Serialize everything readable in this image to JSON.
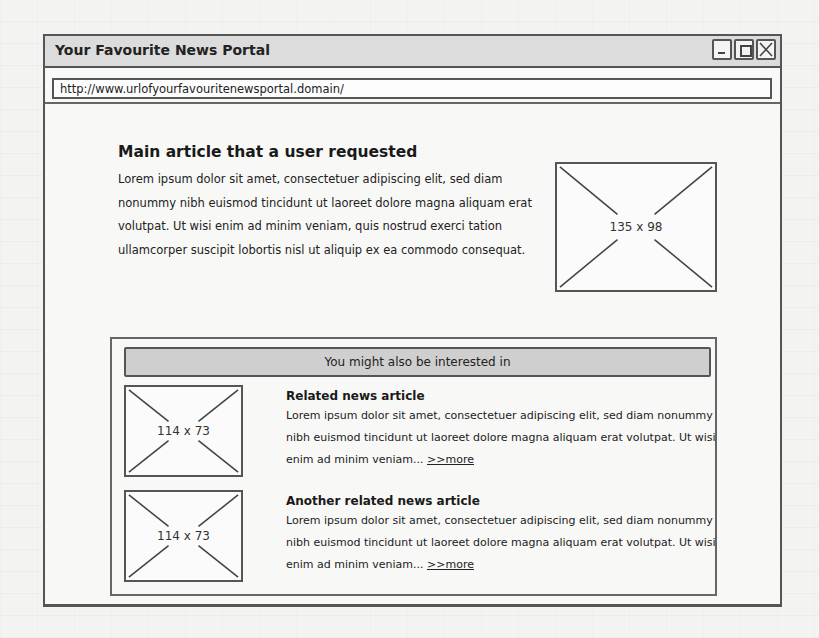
{
  "window": {
    "title": "Your Favourite News Portal",
    "controls": {
      "minimize": "minimize-icon",
      "maximize": "maximize-icon",
      "close": "close-icon"
    }
  },
  "urlbar": {
    "value": "http://www.urlofyourfavouritenewsportal.domain/"
  },
  "main_article": {
    "title": "Main article that a user requested",
    "body": "Lorem ipsum dolor sit amet, consectetuer adipiscing elit, sed diam nonummy nibh euismod tincidunt ut laoreet dolore magna aliquam erat volutpat. Ut wisi enim ad minim veniam, quis nostrud exerci tation ullamcorper suscipit lobortis nisl ut aliquip ex ea commodo consequat.",
    "image_label": "135 x 98"
  },
  "related": {
    "header": "You might also be interested in",
    "items": [
      {
        "title": "Related news article",
        "body": "Lorem ipsum dolor sit amet, consectetuer adipiscing elit, sed diam nonummy nibh euismod tincidunt ut laoreet dolore magna aliquam erat volutpat. Ut wisi enim ad minim veniam... ",
        "more": ">>more",
        "image_label": "114 x 73"
      },
      {
        "title": "Another related news article",
        "body": "Lorem ipsum dolor sit amet, consectetuer adipiscing elit, sed diam nonummy nibh euismod tincidunt ut laoreet dolore magna aliquam erat volutpat. Ut wisi enim ad minim veniam... ",
        "more": ">>more",
        "image_label": "114 x 73"
      }
    ]
  },
  "colors": {
    "titlebar_bg": "#dcdcdc",
    "related_header_bg": "#cfcfcf",
    "border": "#555555"
  }
}
